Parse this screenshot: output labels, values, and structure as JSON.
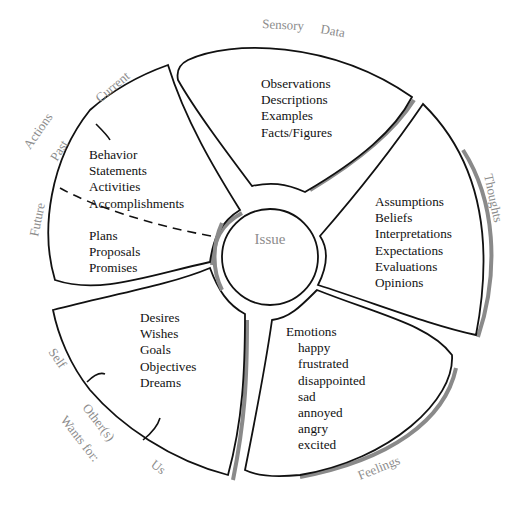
{
  "diagram": {
    "center": {
      "label": "Issue"
    },
    "segments": [
      {
        "id": "sensory-data",
        "category_label": [
          "Sensory",
          "Data"
        ],
        "items": [
          "Observations",
          "Descriptions",
          "Examples",
          "Facts/Figures"
        ]
      },
      {
        "id": "thoughts",
        "category_label": "Thoughts",
        "items": [
          "Assumptions",
          "Beliefs",
          "Interpretations",
          "Expectations",
          "Evaluations",
          "Opinions"
        ]
      },
      {
        "id": "feelings",
        "category_label": "Feelings",
        "heading": "Emotions",
        "items": [
          "happy",
          "frustrated",
          "disappointed",
          "sad",
          "annoyed",
          "angry",
          "excited"
        ]
      },
      {
        "id": "wants",
        "category_label": "Wants for:",
        "sub_labels": [
          "Self",
          "Other(s)",
          "Us"
        ],
        "items": [
          "Desires",
          "Wishes",
          "Goals",
          "Objectives",
          "Dreams"
        ]
      },
      {
        "id": "actions",
        "category_label": "Actions",
        "sub_labels": [
          "Current",
          "Past",
          "Future"
        ],
        "items_past": [
          "Behavior",
          "Statements",
          "Activities",
          "Accomplishments"
        ],
        "items_future": [
          "Plans",
          "Proposals",
          "Promises"
        ]
      }
    ]
  }
}
